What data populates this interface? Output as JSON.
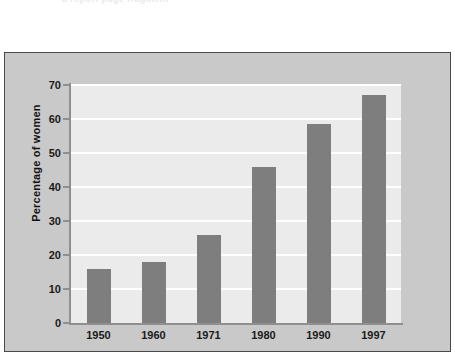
{
  "scan": {
    "header_fragment": "a report page fragment"
  },
  "chart_data": {
    "type": "bar",
    "title": "",
    "xlabel": "",
    "ylabel": "Percentage of women",
    "categories": [
      "1950",
      "1960",
      "1971",
      "1980",
      "1990",
      "1997"
    ],
    "values": [
      16,
      18,
      26,
      46,
      58.5,
      67
    ],
    "ylim": [
      0,
      70
    ],
    "ytick_labels": [
      "0",
      "10",
      "20",
      "30",
      "40",
      "50",
      "60",
      "70"
    ],
    "ytick_values": [
      0,
      10,
      20,
      30,
      40,
      50,
      60,
      70
    ],
    "grid": "horizontal-white-gridlines",
    "legend": "none",
    "colors": {
      "bar": "#7e7e7e",
      "plot_background": "#ebebeb",
      "figure_background": "#c9c9c9",
      "gridline": "#ffffff",
      "axis": "#8f8f8f",
      "frame_border": "#4a4a4a",
      "text": "#1a1a1a"
    }
  }
}
